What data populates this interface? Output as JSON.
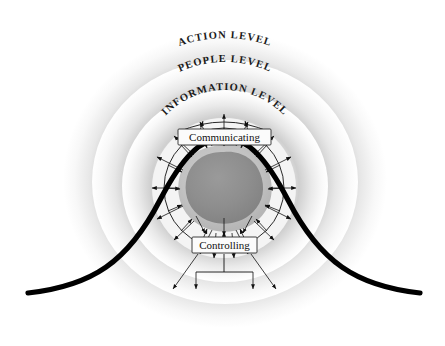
{
  "figure": {
    "background_color": "#ffffff"
  },
  "rings": [
    {
      "id": "action",
      "label": "ACTION LEVEL",
      "order": 1,
      "position": "outermost",
      "band_color_light": "#fdfdfd",
      "band_color_shadow": "#d3d3d3"
    },
    {
      "id": "people",
      "label": "PEOPLE LEVEL",
      "order": 2,
      "position": "middle",
      "band_color_light": "#fdfdfd",
      "band_color_shadow": "#d3d3d3"
    },
    {
      "id": "information",
      "label": "INFORMATION LEVEL",
      "order": 3,
      "position": "inner",
      "band_color_light": "#fdfdfd",
      "band_color_shadow": "#d3d3d3"
    }
  ],
  "core": {
    "blob_color": "#8d8d8d",
    "halo_color": "#c0c0c0",
    "label": ""
  },
  "boxes": [
    {
      "id": "communicating",
      "label": "Communicating"
    },
    {
      "id": "controlling",
      "label": "Controlling"
    }
  ],
  "curve": {
    "id": "bell-curve",
    "shape": "bell",
    "color": "#000000",
    "stroke_width": 5
  },
  "arrows": {
    "inward_count": 16,
    "outward_count": 16,
    "downward_count": 5,
    "color": "#111111"
  }
}
